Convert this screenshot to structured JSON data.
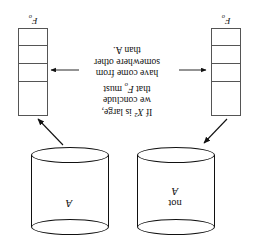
{
  "figure": {
    "rotation_degrees": 180,
    "background_color": "#ffffff",
    "stroke_color": "#111111",
    "box_stroke_color": "#555555"
  },
  "cylinders": [
    {
      "id": "cylinder-not-a",
      "label_line1": "not",
      "label_line2": "A"
    },
    {
      "id": "cylinder-a",
      "label_line1": "",
      "label_line2": "A"
    }
  ],
  "frequency_boxes": [
    {
      "id": "freq-box-left",
      "label_base": "F",
      "label_sub": "o",
      "cells": 4
    },
    {
      "id": "freq-box-right",
      "label_base": "F",
      "label_sub": "o",
      "cells": 4
    }
  ],
  "caption": {
    "line1_pre": "If ",
    "line1_var": "X",
    "line1_sup": "2",
    "line1_post": " is large,",
    "line2": "we conclude",
    "line3_pre": "that ",
    "line3_var": "F",
    "line3_sub": "o",
    "line3_post": " must",
    "line4": "have come from",
    "line5": "somewhere other",
    "line6": "than A."
  },
  "arrows": [
    {
      "id": "arrow-box-left-to-cylinder-not-a",
      "direction": "up-right"
    },
    {
      "id": "arrow-cylinder-a-to-box-right",
      "direction": "down-right"
    },
    {
      "id": "arrow-caption-to-box-left",
      "direction": "left"
    },
    {
      "id": "arrow-caption-to-box-right",
      "direction": "right"
    }
  ]
}
